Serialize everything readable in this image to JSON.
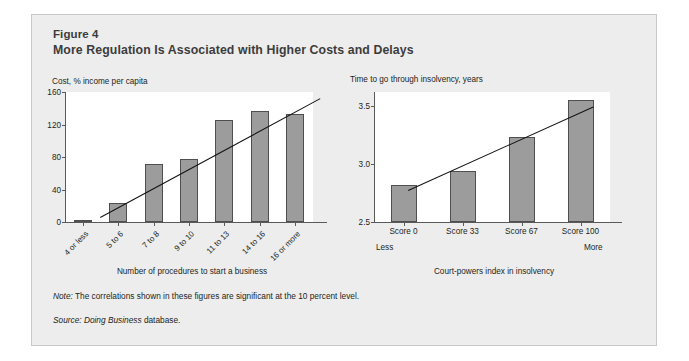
{
  "figure": {
    "number": "Figure 4",
    "title": "More Regulation Is Associated with Higher Costs and Delays",
    "note_label": "Note:",
    "note_text": "The correlations shown in these figures are significant at the 10 percent level.",
    "source_label": "Source:",
    "source_italic": "Doing Business",
    "source_text": "database."
  },
  "colors": {
    "panel_background": "#ededed",
    "panel_border": "#c9c9c9",
    "plot_background": "#ffffff",
    "bar_fill": "#9c9c9c",
    "bar_stroke": "#4f4f4f",
    "trendline": "#111111",
    "axis": "#5a5a5a",
    "text": "#231f20",
    "title_text": "#3c3c3c"
  },
  "chart_data": [
    {
      "type": "bar",
      "id": "cost-chart",
      "title": "Cost, % income per capita",
      "ylabel": "Cost, % income per capita",
      "xlabel": "Number of procedures to start a business",
      "categories": [
        "4 or less",
        "5 to 6",
        "7 to 8",
        "9 to 10",
        "11 to 13",
        "14 to 16",
        "16 or more"
      ],
      "values": [
        3,
        24,
        72,
        78,
        126,
        137,
        133
      ],
      "yticks": [
        "0",
        "40",
        "80",
        "120",
        "160"
      ],
      "ytick_values": [
        0,
        40,
        80,
        120,
        160
      ],
      "ylim": [
        0,
        160
      ],
      "grid": false,
      "legend": null,
      "trendline": {
        "x_start": 0.5,
        "y_start": 6,
        "x_end": 6.7,
        "y_end": 152
      }
    },
    {
      "type": "bar",
      "id": "insolvency-chart",
      "title": "Time to go through insolvency, years",
      "ylabel": "Time to go through insolvency, years",
      "xlabel": "Court-powers index in insolvency",
      "categories": [
        "Score 0",
        "Score 33",
        "Score 67",
        "Score 100"
      ],
      "values": [
        2.82,
        2.94,
        3.23,
        3.55
      ],
      "yticks": [
        "2.5",
        "3.0",
        "3.5"
      ],
      "ytick_values": [
        2.5,
        3.0,
        3.5
      ],
      "ylim": [
        2.5,
        3.62
      ],
      "grid": false,
      "legend": null,
      "axis_end_labels": {
        "left": "Less",
        "right": "More"
      },
      "trendline": {
        "x_start": 0.08,
        "y_start": 2.78,
        "x_end": 3.22,
        "y_end": 3.5
      }
    }
  ]
}
